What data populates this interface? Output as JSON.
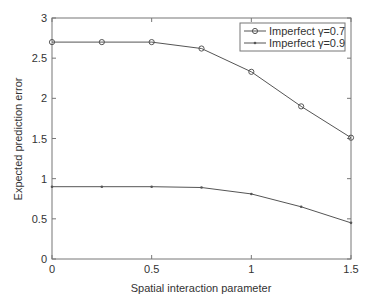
{
  "chart_data": {
    "type": "line",
    "title": "",
    "xlabel": "Spatial interaction parameter",
    "ylabel": "Expected prediction error",
    "xlim": [
      0,
      1.5
    ],
    "ylim": [
      0,
      3
    ],
    "xticks": [
      0,
      0.5,
      1,
      1.5
    ],
    "xtick_labels": [
      "0",
      "0.5",
      "1",
      "1.5"
    ],
    "yticks": [
      0,
      0.5,
      1,
      1.5,
      2,
      2.5,
      3
    ],
    "ytick_labels": [
      "0",
      "0.5",
      "1",
      "1.5",
      "2",
      "2.5",
      "3"
    ],
    "grid": false,
    "legend_position": "upper right",
    "x": [
      0,
      0.25,
      0.5,
      0.75,
      1.0,
      1.25,
      1.5
    ],
    "series": [
      {
        "name": "Imperfect γ=0.7",
        "marker": "circle",
        "color": "#555555",
        "values": [
          2.7,
          2.7,
          2.7,
          2.62,
          2.33,
          1.9,
          1.51
        ]
      },
      {
        "name": "Imperfect γ=0.9",
        "marker": "point",
        "color": "#555555",
        "values": [
          0.9,
          0.9,
          0.9,
          0.89,
          0.81,
          0.65,
          0.45
        ]
      }
    ]
  }
}
